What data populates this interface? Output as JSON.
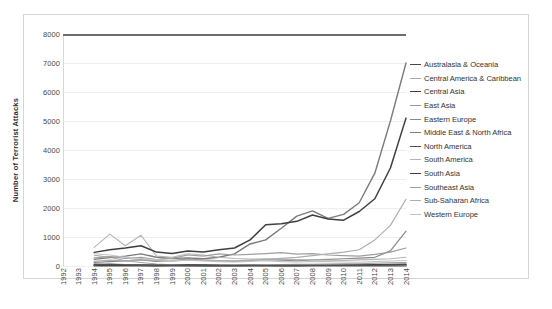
{
  "chart_data": {
    "type": "line",
    "title": "",
    "xlabel": "",
    "ylabel": "Number of Terrorist Attacks",
    "xlim": [
      1992,
      2014
    ],
    "ylim": [
      0,
      8000
    ],
    "ytick_step": 1000,
    "grid": true,
    "legend_position": "right",
    "x": [
      1992,
      1993,
      1994,
      1995,
      1996,
      1997,
      1998,
      1999,
      2000,
      2001,
      2002,
      2003,
      2004,
      2005,
      2006,
      2007,
      2008,
      2009,
      2010,
      2011,
      2012,
      2013,
      2014
    ],
    "ytick_labels": [
      "8000",
      "7000",
      "6000",
      "5000",
      "4000",
      "3000",
      "2000",
      "1000",
      "0"
    ],
    "xtick_labels": [
      "1992",
      "1993",
      "1994",
      "1995",
      "1996",
      "1997",
      "1998",
      "1999",
      "2000",
      "2001",
      "2002",
      "2003",
      "2004",
      "2005",
      "2006",
      "2007",
      "2008",
      "2009",
      "2010",
      "2011",
      "2012",
      "2013",
      "2014"
    ],
    "series": [
      {
        "name": "Australasia & Oceania",
        "color": "#4a4a4a",
        "width": 1.5,
        "values": [
          0,
          0,
          12,
          8,
          6,
          5,
          4,
          6,
          5,
          4,
          3,
          5,
          6,
          8,
          10,
          9,
          12,
          10,
          8,
          9,
          11,
          10,
          12
        ]
      },
      {
        "name": "Central America & Caribbean",
        "color": "#a8a8a8",
        "width": 1.1,
        "values": [
          0,
          0,
          370,
          300,
          180,
          120,
          70,
          45,
          30,
          22,
          18,
          15,
          14,
          12,
          10,
          14,
          12,
          10,
          9,
          8,
          10,
          12,
          14
        ]
      },
      {
        "name": "Central Asia",
        "color": "#3b3b3b",
        "width": 1.5,
        "values": [
          0,
          0,
          30,
          55,
          40,
          35,
          28,
          22,
          40,
          35,
          25,
          20,
          22,
          25,
          20,
          18,
          22,
          25,
          30,
          35,
          45,
          50,
          60
        ]
      },
      {
        "name": "East Asia",
        "color": "#9a9a9a",
        "width": 1.1,
        "values": [
          0,
          0,
          45,
          60,
          50,
          40,
          35,
          30,
          28,
          25,
          30,
          35,
          40,
          45,
          50,
          55,
          60,
          70,
          75,
          80,
          95,
          110,
          120
        ]
      },
      {
        "name": "Eastern Europe",
        "color": "#888888",
        "width": 1.2,
        "values": [
          0,
          0,
          120,
          150,
          180,
          210,
          160,
          190,
          240,
          200,
          180,
          160,
          190,
          220,
          200,
          180,
          210,
          230,
          250,
          270,
          300,
          520,
          1200
        ]
      },
      {
        "name": "Middle East & North Africa",
        "color": "#7b7b7b",
        "width": 1.4,
        "values": [
          0,
          0,
          230,
          290,
          340,
          420,
          300,
          260,
          280,
          250,
          300,
          420,
          760,
          900,
          1300,
          1720,
          1900,
          1640,
          1780,
          2180,
          3200,
          5000,
          7000
        ]
      },
      {
        "name": "North America",
        "color": "#4f4f4f",
        "width": 1.4,
        "values": [
          0,
          0,
          60,
          50,
          40,
          35,
          25,
          20,
          18,
          30,
          22,
          18,
          15,
          14,
          16,
          18,
          20,
          22,
          25,
          28,
          30,
          35,
          40
        ]
      },
      {
        "name": "South America",
        "color": "#b4b4b4",
        "width": 1.1,
        "values": [
          0,
          0,
          640,
          1100,
          700,
          1060,
          340,
          300,
          420,
          380,
          300,
          260,
          240,
          250,
          230,
          220,
          210,
          200,
          190,
          210,
          230,
          250,
          300
        ]
      },
      {
        "name": "South Asia",
        "color": "#3f3f3f",
        "width": 1.5,
        "values": [
          0,
          0,
          470,
          560,
          620,
          700,
          480,
          430,
          520,
          480,
          560,
          620,
          900,
          1420,
          1460,
          1540,
          1760,
          1620,
          1580,
          1880,
          2320,
          3380,
          5100
        ]
      },
      {
        "name": "Southeast Asia",
        "color": "#9e9e9e",
        "width": 1.2,
        "values": [
          0,
          0,
          280,
          320,
          260,
          300,
          220,
          260,
          380,
          340,
          420,
          380,
          400,
          430,
          460,
          410,
          430,
          380,
          360,
          340,
          400,
          480,
          620
        ]
      },
      {
        "name": "Sub-Saharan Africa",
        "color": "#adadad",
        "width": 1.2,
        "values": [
          0,
          0,
          160,
          200,
          180,
          220,
          190,
          170,
          210,
          200,
          190,
          180,
          200,
          230,
          260,
          300,
          360,
          420,
          480,
          560,
          900,
          1400,
          2300
        ]
      },
      {
        "name": "Western Europe",
        "color": "#c2c2c2",
        "width": 1.1,
        "values": [
          0,
          0,
          420,
          380,
          300,
          260,
          220,
          180,
          200,
          170,
          150,
          140,
          160,
          180,
          150,
          140,
          160,
          150,
          140,
          130,
          150,
          170,
          190
        ]
      }
    ]
  }
}
